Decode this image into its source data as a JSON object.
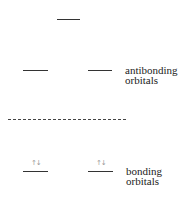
{
  "diagram": {
    "type": "molecular-orbital-energy-levels",
    "levels": [
      {
        "id": "top-antibonding",
        "group": "antibonding",
        "electrons": ""
      },
      {
        "id": "antibonding-left",
        "group": "antibonding",
        "electrons": ""
      },
      {
        "id": "antibonding-right",
        "group": "antibonding",
        "electrons": ""
      },
      {
        "id": "bonding-left",
        "group": "bonding",
        "electrons": "↑↓"
      },
      {
        "id": "bonding-right",
        "group": "bonding",
        "electrons": "↑↓"
      }
    ],
    "separator": "dashed",
    "labels": {
      "antibonding_line1": "antibonding",
      "antibonding_line2": "orbitals",
      "bonding_line1": "bonding",
      "bonding_line2": "orbitals"
    }
  }
}
